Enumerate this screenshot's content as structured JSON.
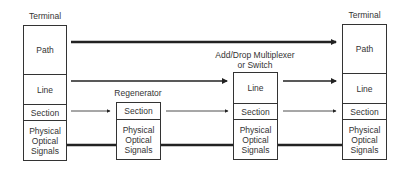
{
  "nodes": {
    "terminal_left": {
      "title": "Terminal",
      "layers": [
        "Path",
        "Line",
        "Section",
        "Physical Optical Signals"
      ]
    },
    "regenerator": {
      "title": "Regenerator",
      "layers": [
        "Section",
        "Physical Optical Signals"
      ]
    },
    "adm": {
      "title_line1": "Add/Drop Multiplexer",
      "title_line2": "or Switch",
      "layers": [
        "Line",
        "Section",
        "Physical Optical Signals"
      ]
    },
    "terminal_right": {
      "title": "Terminal",
      "layers": [
        "Path",
        "Line",
        "Section",
        "Physical Optical Signals"
      ]
    }
  },
  "physical_label": {
    "l1": "Physical",
    "l2": "Optical",
    "l3": "Signals"
  },
  "connections": [
    {
      "layer": "Path",
      "from": "terminal_left",
      "to": "terminal_right",
      "style": "thick-arrow"
    },
    {
      "layer": "Line",
      "from": "terminal_left",
      "to": "adm",
      "style": "medium-arrow"
    },
    {
      "layer": "Line",
      "from": "adm",
      "to": "terminal_right",
      "style": "medium-arrow"
    },
    {
      "layer": "Section",
      "from": "terminal_left",
      "to": "regenerator",
      "style": "thin-arrow"
    },
    {
      "layer": "Section",
      "from": "regenerator",
      "to": "adm",
      "style": "thin-arrow"
    },
    {
      "layer": "Section",
      "from": "adm",
      "to": "terminal_right",
      "style": "thin-arrow"
    },
    {
      "layer": "Physical",
      "from": "terminal_left",
      "to": "terminal_right",
      "style": "thick-line"
    }
  ],
  "colors": {
    "stroke": "#222222",
    "background": "#ffffff"
  }
}
